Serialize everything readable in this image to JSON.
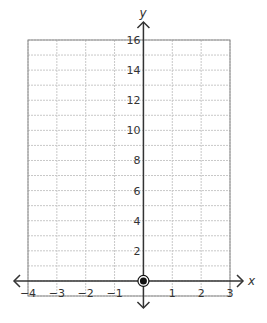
{
  "chart_data": {
    "type": "scatter",
    "title": "",
    "xlabel": "x",
    "ylabel": "y",
    "xlim": [
      -4,
      3
    ],
    "ylim": [
      -1,
      16
    ],
    "x_ticks": [
      -4,
      -3,
      -2,
      -1,
      1,
      2,
      3
    ],
    "x_tick_labels": [
      "−4",
      "−3",
      "−2",
      "−1",
      "1",
      "2",
      "3"
    ],
    "y_ticks": [
      2,
      4,
      6,
      8,
      10,
      12,
      14,
      16
    ],
    "y_tick_labels": [
      "2",
      "4",
      "6",
      "8",
      "10",
      "12",
      "14",
      "16"
    ],
    "grid": true,
    "grid_x_step": 1,
    "grid_y_step": 1,
    "points": [
      {
        "x": 0,
        "y": 0,
        "style": "filled-dot-with-ring"
      }
    ],
    "legend": null
  },
  "colors": {
    "axis": "#333333",
    "grid": "#c8c8c8",
    "border": "#888888",
    "point": "#111111"
  }
}
